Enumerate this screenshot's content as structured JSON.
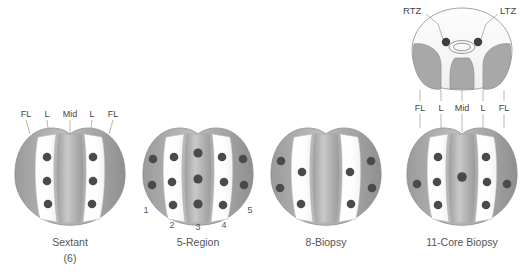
{
  "figure": {
    "background_color": "#ffffff",
    "outline_color": "#8c8c8c",
    "dot_color": "#4a4a4a",
    "shaded_zone_color": "#a8a8a8",
    "white_zone_color": "#ffffff"
  },
  "transverse_view": {
    "name": "transverse-prostate-cross-section",
    "labels": {
      "right_transition_zone": "RTZ",
      "left_transition_zone": "LTZ"
    },
    "zone_labels": [
      "FL",
      "L",
      "Mid",
      "L",
      "FL"
    ],
    "transition_zone_cores": 2,
    "urethra": "central-double-ellipse"
  },
  "schemes": [
    {
      "id": "sextant",
      "caption": "Sextant",
      "subcaption": "(6)",
      "core_count": 6,
      "zone_labels": [
        "FL",
        "L",
        "Mid",
        "L",
        "FL"
      ],
      "cores_per_zone": {
        "FL_left": 0,
        "L_left": 3,
        "Mid": 0,
        "L_right": 3,
        "FL_right": 0
      },
      "numbered_regions": []
    },
    {
      "id": "five-region",
      "caption": "5-Region",
      "subcaption": "",
      "core_count": 13,
      "zone_labels": [],
      "cores_per_zone": {
        "FL_left": 2,
        "L_left": 3,
        "Mid": 3,
        "L_right": 3,
        "FL_right": 2
      },
      "numbered_regions": [
        "1",
        "2",
        "3",
        "4",
        "5"
      ]
    },
    {
      "id": "eight-biopsy",
      "caption": "8-Biopsy",
      "subcaption": "",
      "core_count": 8,
      "zone_labels": [],
      "cores_per_zone": {
        "FL_left": 2,
        "L_left": 2,
        "Mid": 0,
        "L_right": 2,
        "FL_right": 2
      },
      "numbered_regions": []
    },
    {
      "id": "eleven-core-biopsy",
      "caption": "11-Core Biopsy",
      "subcaption": "",
      "core_count": 11,
      "zone_labels": [
        "FL",
        "L",
        "Mid",
        "L",
        "FL"
      ],
      "cores_per_zone": {
        "FL_left": 1,
        "L_left": 3,
        "Mid": 1,
        "L_right": 3,
        "FL_right": 1
      },
      "transition_zone_cores": 2,
      "numbered_regions": []
    }
  ]
}
